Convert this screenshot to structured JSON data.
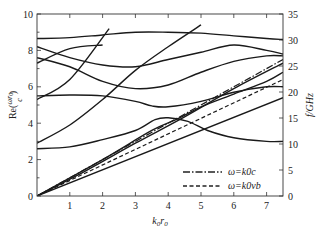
{
  "chart_data": {
    "type": "line",
    "title": "",
    "xlabel": "k0r0",
    "ylabel": "Re(ωr0/c)",
    "ylabel_right": "f/GHz",
    "xlim": [
      0,
      7.5
    ],
    "ylim": [
      0,
      10
    ],
    "ylim_right": [
      0,
      35
    ],
    "grid": false,
    "legend_position": "lower right",
    "x_ticks": [
      "1",
      "2",
      "3",
      "4",
      "5",
      "6",
      "7"
    ],
    "y_ticks": [
      "0",
      "2",
      "4",
      "6",
      "8",
      "10"
    ],
    "y_ticks_right": [
      "0",
      "5",
      "10",
      "15",
      "20",
      "25",
      "30",
      "35"
    ],
    "legend": [
      {
        "label": "ω=k0c",
        "style": "dash-dot"
      },
      {
        "label": "ω=k0vb",
        "style": "dashed"
      }
    ],
    "series": [
      {
        "name": "light line ω=k0c",
        "style": "dash-dot",
        "points": [
          [
            0,
            0
          ],
          [
            7.5,
            7.5
          ]
        ]
      },
      {
        "name": "beam line ω=k0vb",
        "style": "dashed",
        "points": [
          [
            0,
            0
          ],
          [
            7.5,
            6.4
          ]
        ]
      },
      {
        "name": "mode 1 (lowest slow line)",
        "style": "solid",
        "points": [
          [
            0,
            0
          ],
          [
            7.5,
            5.4
          ]
        ]
      },
      {
        "name": "mode 2 (near light line)",
        "style": "solid",
        "points": [
          [
            0,
            0
          ],
          [
            1.5,
            1.4
          ],
          [
            3,
            2.9
          ],
          [
            4.5,
            4.35
          ],
          [
            6,
            5.9
          ],
          [
            7.5,
            7.3
          ]
        ]
      },
      {
        "name": "mode 3 (band starting 2.6)",
        "style": "solid",
        "points": [
          [
            0,
            2.6
          ],
          [
            1,
            2.7
          ],
          [
            2,
            3.1
          ],
          [
            3,
            3.6
          ],
          [
            3.6,
            4.2
          ],
          [
            4,
            4.3
          ],
          [
            4.6,
            4.1
          ],
          [
            5.2,
            3.6
          ],
          [
            6,
            3.2
          ],
          [
            7,
            3.0
          ],
          [
            7.5,
            3.0
          ]
        ]
      },
      {
        "name": "mode 4 (slanted through crossing)",
        "style": "solid",
        "points": [
          [
            0,
            0
          ],
          [
            2,
            2.0
          ],
          [
            3.5,
            3.6
          ],
          [
            4.3,
            4.25
          ],
          [
            5,
            4.9
          ],
          [
            6,
            5.6
          ],
          [
            7,
            6.3
          ],
          [
            7.5,
            6.8
          ]
        ]
      },
      {
        "name": "mode 5 (band starting 5.4)",
        "style": "solid",
        "points": [
          [
            0,
            5.5
          ],
          [
            1,
            5.55
          ],
          [
            2,
            5.5
          ],
          [
            3,
            5.2
          ],
          [
            3.5,
            4.95
          ],
          [
            4,
            4.9
          ],
          [
            5,
            5.2
          ],
          [
            6,
            5.7
          ],
          [
            7,
            6.0
          ],
          [
            7.5,
            6.0
          ]
        ]
      },
      {
        "name": "mode 6 (band starting 7.6)",
        "style": "solid",
        "points": [
          [
            0,
            7.6
          ],
          [
            1,
            7.1
          ],
          [
            2,
            6.3
          ],
          [
            3,
            5.9
          ],
          [
            4,
            6.1
          ],
          [
            5,
            6.8
          ],
          [
            6,
            7.4
          ],
          [
            7,
            7.7
          ],
          [
            7.5,
            7.7
          ]
        ]
      },
      {
        "name": "mode 7 (band starting 8.2)",
        "style": "solid",
        "points": [
          [
            0,
            8.2
          ],
          [
            1,
            7.6
          ],
          [
            2,
            7.2
          ],
          [
            3,
            7.1
          ],
          [
            4,
            7.5
          ],
          [
            5,
            7.9
          ],
          [
            6,
            8.3
          ],
          [
            7,
            8.0
          ],
          [
            7.5,
            7.8
          ]
        ]
      },
      {
        "name": "mode 8 (top band)",
        "style": "solid",
        "points": [
          [
            0,
            8.65
          ],
          [
            1,
            8.7
          ],
          [
            2,
            8.85
          ],
          [
            3,
            9.0
          ],
          [
            4,
            9.0
          ],
          [
            5,
            8.95
          ],
          [
            6,
            8.8
          ],
          [
            7,
            8.65
          ],
          [
            7.5,
            8.6
          ]
        ]
      },
      {
        "name": "space harmonic line 1",
        "style": "solid",
        "points": [
          [
            0,
            5.3
          ],
          [
            1,
            6.4
          ],
          [
            2.2,
            9.2
          ]
        ]
      },
      {
        "name": "space harmonic line 2",
        "style": "solid",
        "points": [
          [
            0,
            2.9
          ],
          [
            1,
            3.9
          ],
          [
            2,
            5.3
          ],
          [
            3,
            6.9
          ],
          [
            4,
            8.2
          ],
          [
            5,
            9.4
          ]
        ]
      },
      {
        "name": "crossing line (7.3 down-right)",
        "style": "solid",
        "points": [
          [
            0,
            7.3
          ],
          [
            1,
            8.1
          ],
          [
            2,
            8.3
          ]
        ]
      }
    ]
  }
}
